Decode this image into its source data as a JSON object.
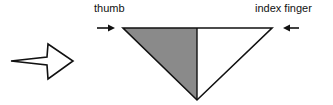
{
  "labels": {
    "thumb": "thumb",
    "index": "index finger"
  },
  "colors": {
    "stroke": "#111111",
    "shaded": "#8a8a8a",
    "unshaded": "#ffffff"
  },
  "shapes": {
    "direction_arrow": "outline arrow pointing right",
    "triangle": "inverted triangle split vertically: left half shaded (thumb side), right half white (index finger side)"
  }
}
